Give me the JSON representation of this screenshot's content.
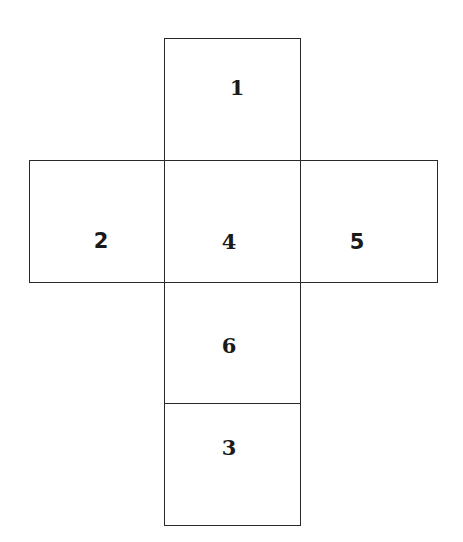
{
  "diagram": {
    "type": "cube-net",
    "faces": [
      {
        "id": "top",
        "label": "1"
      },
      {
        "id": "left",
        "label": "2"
      },
      {
        "id": "center",
        "label": "4"
      },
      {
        "id": "right",
        "label": "5"
      },
      {
        "id": "below",
        "label": "6"
      },
      {
        "id": "bottom",
        "label": "3"
      }
    ]
  }
}
